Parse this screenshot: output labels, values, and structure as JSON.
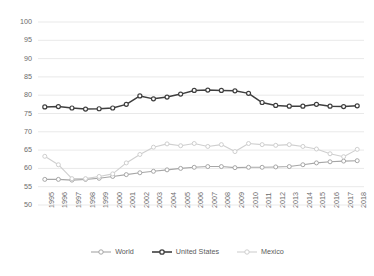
{
  "chart_data": {
    "type": "line",
    "title": "",
    "subtitle": "",
    "xlabel": "",
    "ylabel": "",
    "ylim": [
      50,
      100
    ],
    "ytick_step": 5,
    "yticks": [
      50,
      55,
      60,
      65,
      70,
      75,
      80,
      85,
      90,
      95,
      100
    ],
    "grid": true,
    "grid_axis": "y",
    "legend_position": "bottom",
    "categories": [
      "1995",
      "1996",
      "1997",
      "1998",
      "1999",
      "2000",
      "2001",
      "2002",
      "2003",
      "2004",
      "2005",
      "2006",
      "2007",
      "2008",
      "2009",
      "2010",
      "2011",
      "2012",
      "2013",
      "2014",
      "2015",
      "2016",
      "2017",
      "2018"
    ],
    "series": [
      {
        "name": "World",
        "color": "#a6a6a6",
        "marker": "circle-open",
        "values": [
          57.0,
          57.0,
          56.8,
          57.0,
          57.3,
          57.8,
          58.3,
          58.8,
          59.2,
          59.6,
          60.0,
          60.3,
          60.5,
          60.5,
          60.2,
          60.3,
          60.3,
          60.4,
          60.5,
          61.0,
          61.5,
          61.8,
          62.0,
          62.1
        ]
      },
      {
        "name": "United States",
        "color": "#3f3f3f",
        "marker": "circle-open",
        "values": [
          76.8,
          76.9,
          76.5,
          76.2,
          76.3,
          76.5,
          77.5,
          79.8,
          79.0,
          79.5,
          80.3,
          81.3,
          81.4,
          81.3,
          81.2,
          80.5,
          78.0,
          77.2,
          77.0,
          77.0,
          77.5,
          77.0,
          76.9,
          77.1
        ]
      },
      {
        "name": "Mexico",
        "color": "#cfcfcf",
        "marker": "circle-open",
        "values": [
          63.3,
          61.0,
          57.2,
          57.2,
          57.8,
          58.5,
          61.5,
          63.8,
          65.8,
          66.7,
          66.2,
          66.8,
          66.0,
          66.5,
          64.6,
          66.8,
          66.5,
          66.3,
          66.5,
          66.0,
          65.3,
          64.0,
          63.2,
          65.2
        ]
      }
    ]
  },
  "axes": {
    "y_tick_labels": [
      "100",
      "95",
      "90",
      "85",
      "80",
      "75",
      "70",
      "65",
      "60",
      "55",
      "50"
    ],
    "x_tick_labels": [
      "1995",
      "1996",
      "1997",
      "1998",
      "1999",
      "2000",
      "2001",
      "2002",
      "2003",
      "2004",
      "2005",
      "2006",
      "2007",
      "2008",
      "2009",
      "2010",
      "2011",
      "2012",
      "2013",
      "2014",
      "2015",
      "2016",
      "2017",
      "2018"
    ]
  },
  "legend": {
    "items": [
      {
        "label": "World",
        "color": "#a6a6a6"
      },
      {
        "label": "United States",
        "color": "#3f3f3f"
      },
      {
        "label": "Mexico",
        "color": "#cfcfcf"
      }
    ]
  },
  "style": {
    "background": "#ffffff",
    "gridline_color": "#e9e9e9",
    "tick_text_color": "#6b6b6b"
  }
}
